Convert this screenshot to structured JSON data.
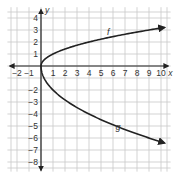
{
  "chart_data": {
    "type": "line",
    "title": "",
    "xlabel": "x",
    "ylabel": "y",
    "xlim": [
      -2.8,
      10.8
    ],
    "ylim": [
      -8.8,
      4.9
    ],
    "grid": true,
    "x_ticks": [
      -2,
      -1,
      1,
      2,
      3,
      4,
      5,
      6,
      7,
      8,
      9,
      10
    ],
    "y_ticks": [
      4,
      3,
      2,
      1,
      -2,
      -3,
      -4,
      -5,
      -6,
      -7,
      -8
    ],
    "series": [
      {
        "name": "f",
        "label_position": [
          5.5,
          2.6
        ],
        "points": [
          [
            0,
            0
          ],
          [
            0.25,
            0.5
          ],
          [
            1,
            1
          ],
          [
            2,
            1.41
          ],
          [
            3,
            1.73
          ],
          [
            4,
            2
          ],
          [
            5,
            2.24
          ],
          [
            6,
            2.45
          ],
          [
            7,
            2.65
          ],
          [
            8,
            2.83
          ],
          [
            9,
            3
          ],
          [
            10,
            3.16
          ]
        ]
      },
      {
        "name": "g",
        "label_position": [
          6.2,
          -5.3
        ],
        "points": [
          [
            0,
            0
          ],
          [
            0.25,
            -1
          ],
          [
            1,
            -2
          ],
          [
            2,
            -2.83
          ],
          [
            3,
            -3.46
          ],
          [
            4,
            -4
          ],
          [
            5,
            -4.47
          ],
          [
            6,
            -4.9
          ],
          [
            7,
            -5.29
          ],
          [
            8,
            -5.66
          ],
          [
            9,
            -6
          ],
          [
            10,
            -6.32
          ]
        ]
      }
    ]
  }
}
